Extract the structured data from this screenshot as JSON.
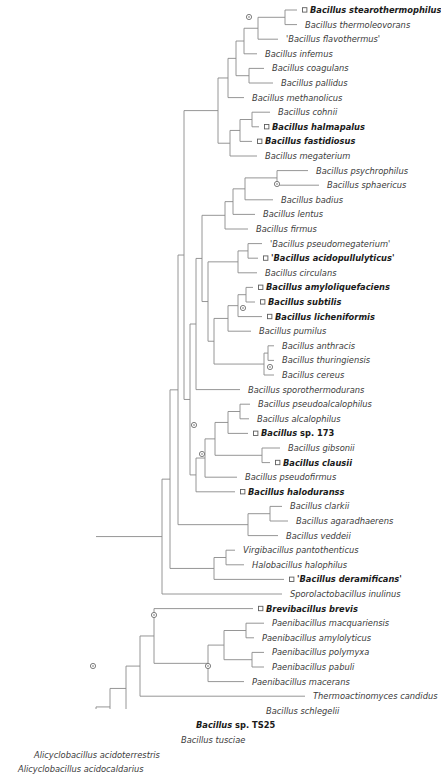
{
  "figure": {
    "type": "phylogram",
    "colors": {
      "branch": "#8a8a8a",
      "label": "#3b3b3b",
      "label_bold": "#1a1a1a",
      "node_marker": "#6f6f6f",
      "background": "#ffffff"
    },
    "marker_legend": {
      "circle_node": "internal-node-support-marker",
      "square_tip": "highlighted-taxon-marker"
    }
  },
  "taxa": [
    {
      "id": "t1",
      "label": "Bacillus stearothermophilus",
      "bold": true,
      "marker": true,
      "x": 310,
      "y": 10,
      "branch_x": 297
    },
    {
      "id": "t2",
      "label": "Bacillus thermoleovorans",
      "bold": false,
      "marker": false,
      "x": 305,
      "y": 24.6,
      "branch_x": 297
    },
    {
      "id": "t3",
      "label": "'Bacillus flavothermus'",
      "bold": false,
      "marker": false,
      "x": 286,
      "y": 39.2,
      "branch_x": 278
    },
    {
      "id": "t4",
      "label": "Bacillus infemus",
      "bold": false,
      "marker": false,
      "x": 265,
      "y": 53.8,
      "branch_x": 257
    },
    {
      "id": "t5",
      "label": "Bacillus coagulans",
      "bold": false,
      "marker": false,
      "x": 272,
      "y": 68.4,
      "branch_x": 264
    },
    {
      "id": "t6",
      "label": "Bacillus pallidus",
      "bold": false,
      "marker": false,
      "x": 281,
      "y": 83,
      "branch_x": 273
    },
    {
      "id": "t7",
      "label": "Bacillus methanolicus",
      "bold": false,
      "marker": false,
      "x": 252,
      "y": 97.6,
      "branch_x": 244
    },
    {
      "id": "t8",
      "label": "Bacillus cohnii",
      "bold": false,
      "marker": false,
      "x": 278,
      "y": 112.2,
      "branch_x": 270
    },
    {
      "id": "t9",
      "label": "Bacillus halmapalus",
      "bold": true,
      "marker": true,
      "x": 272,
      "y": 126.8,
      "branch_x": 259
    },
    {
      "id": "t10",
      "label": "Bacillus fastidiosus",
      "bold": true,
      "marker": true,
      "x": 265,
      "y": 141.4,
      "branch_x": 252
    },
    {
      "id": "t11",
      "label": "Bacillus megaterium",
      "bold": false,
      "marker": false,
      "x": 265,
      "y": 156,
      "branch_x": 257
    },
    {
      "id": "t12",
      "label": "Bacillus psychrophilus",
      "bold": false,
      "marker": false,
      "x": 316,
      "y": 177,
      "branch_x": 308
    },
    {
      "id": "t13",
      "label": "Bacillus sphaericus",
      "bold": false,
      "marker": false,
      "x": 327,
      "y": 191.6,
      "branch_x": 319
    },
    {
      "id": "t14",
      "label": "Bacillus badius",
      "bold": false,
      "marker": false,
      "x": 281,
      "y": 206.2,
      "branch_x": 273
    },
    {
      "id": "t15",
      "label": "Bacillus lentus",
      "bold": false,
      "marker": false,
      "x": 263,
      "y": 220.8,
      "branch_x": 255
    },
    {
      "id": "t16",
      "label": "Bacillus firmus",
      "bold": false,
      "marker": false,
      "x": 256,
      "y": 235.4,
      "branch_x": 248
    },
    {
      "id": "t17",
      "label": "'Bacillus pseudomegaterium'",
      "bold": false,
      "marker": false,
      "x": 270,
      "y": 250,
      "branch_x": 262
    },
    {
      "id": "t18",
      "label": "'Bacillus acidopullulyticus'",
      "bold": true,
      "marker": true,
      "x": 271,
      "y": 264.6,
      "branch_x": 258
    },
    {
      "id": "t19",
      "label": "Bacillus circulans",
      "bold": false,
      "marker": false,
      "x": 265,
      "y": 279.2,
      "branch_x": 257
    },
    {
      "id": "t20",
      "label": "Bacillus amyloliquefaciens",
      "bold": true,
      "marker": true,
      "x": 266,
      "y": 293.8,
      "branch_x": 253
    },
    {
      "id": "t21",
      "label": "Bacillus subtilis",
      "bold": true,
      "marker": true,
      "x": 268,
      "y": 308.4,
      "branch_x": 255
    },
    {
      "id": "t22",
      "label": "Bacillus licheniformis",
      "bold": true,
      "marker": true,
      "x": 275,
      "y": 323,
      "branch_x": 262
    },
    {
      "id": "t23",
      "label": "Bacillus pumilus",
      "bold": false,
      "marker": false,
      "x": 259,
      "y": 337.6,
      "branch_x": 251
    },
    {
      "id": "t24",
      "label": "Bacillus anthracis",
      "bold": false,
      "marker": false,
      "x": 282,
      "y": 352.2,
      "branch_x": 274
    },
    {
      "id": "t25",
      "label": "Bacillus thuringiensis",
      "bold": false,
      "marker": false,
      "x": 282,
      "y": 366.8,
      "branch_x": 274
    },
    {
      "id": "t26",
      "label": "Bacillus cereus",
      "bold": false,
      "marker": false,
      "x": 282,
      "y": 381.4,
      "branch_x": 274
    },
    {
      "id": "t27",
      "label": "Bacillus sporothermodurans",
      "bold": false,
      "marker": false,
      "x": 248,
      "y": 396,
      "branch_x": 240
    },
    {
      "id": "t28",
      "label": "Bacillus pseudoalcalophilus",
      "bold": false,
      "marker": false,
      "x": 258,
      "y": 410.6,
      "branch_x": 250
    },
    {
      "id": "t29",
      "label": "Bacillus alcalophilus",
      "bold": false,
      "marker": false,
      "x": 257,
      "y": 425.2,
      "branch_x": 249
    },
    {
      "id": "t30",
      "label": "Bacillus sp. 173",
      "bold": true,
      "marker": true,
      "x": 261,
      "y": 439.8,
      "branch_x": 248
    },
    {
      "id": "t31",
      "label": "Bacillus gibsonii",
      "bold": false,
      "marker": false,
      "x": 288,
      "y": 454.4,
      "branch_x": 280
    },
    {
      "id": "t32",
      "label": "Bacillus clausii",
      "bold": true,
      "marker": true,
      "x": 283,
      "y": 469,
      "branch_x": 270
    },
    {
      "id": "t33",
      "label": "Bacillus pseudofirmus",
      "bold": false,
      "marker": false,
      "x": 245,
      "y": 483.6,
      "branch_x": 237
    },
    {
      "id": "t34",
      "label": "Bacillus haloduranss",
      "bold": true,
      "marker": true,
      "x": 248,
      "y": 498.2,
      "branch_x": 235
    },
    {
      "id": "t35",
      "label": "Bacillus clarkii",
      "bold": false,
      "marker": false,
      "x": 290,
      "y": 512.8,
      "branch_x": 282
    },
    {
      "id": "t36",
      "label": "Bacillus agaradhaerens",
      "bold": false,
      "marker": false,
      "x": 296,
      "y": 527.4,
      "branch_x": 288
    },
    {
      "id": "t37",
      "label": "Bacillus veddeii",
      "bold": false,
      "marker": false,
      "x": 286,
      "y": 542,
      "branch_x": 278
    },
    {
      "id": "t38",
      "label": "Virgibacillus pantothenticus",
      "bold": false,
      "marker": false,
      "x": 243,
      "y": 556.6,
      "branch_x": 235
    },
    {
      "id": "t39",
      "label": "Halobacillus halophilus",
      "bold": false,
      "marker": false,
      "x": 252,
      "y": 571.2,
      "branch_x": 244
    },
    {
      "id": "t40",
      "label": "'Bacillus deramificans'",
      "bold": true,
      "marker": true,
      "x": 297,
      "y": 585.8,
      "branch_x": 284
    },
    {
      "id": "t41",
      "label": "Sporolactobacillus inulinus",
      "bold": false,
      "marker": false,
      "x": 290,
      "y": 600.4,
      "branch_x": 282
    },
    {
      "id": "t42",
      "label": "Brevibacillus brevis",
      "bold": true,
      "marker": true,
      "x": 266,
      "y": 615,
      "branch_x": 253
    },
    {
      "id": "t43",
      "label": "Paenibacillus macquariensis",
      "bold": false,
      "marker": false,
      "x": 272,
      "y": 629.6,
      "branch_x": 264
    },
    {
      "id": "t44",
      "label": "Paenibacillus amylolyticus",
      "bold": false,
      "marker": false,
      "x": 262,
      "y": 644.2,
      "branch_x": 254
    },
    {
      "id": "t45",
      "label": "Paenibacillus polymyxa",
      "bold": false,
      "marker": false,
      "x": 272,
      "y": 658.8,
      "branch_x": 264
    },
    {
      "id": "t46",
      "label": "Paenibacillus pabuli",
      "bold": false,
      "marker": false,
      "x": 272,
      "y": 673.4,
      "branch_x": 264
    },
    {
      "id": "t47",
      "label": "Paenibacillus macerans",
      "bold": false,
      "marker": false,
      "x": 252,
      "y": 688,
      "branch_x": 244
    },
    {
      "id": "t48",
      "label": "Thermoactinomyces candidus",
      "bold": false,
      "marker": false,
      "x": 313,
      "y": 702.6,
      "branch_x": 305
    },
    {
      "id": "t49",
      "label": "Bacillus schlegelii",
      "bold": false,
      "marker": false,
      "x": 266,
      "y": 717.2,
      "branch_x": 258
    },
    {
      "id": "t50",
      "label": "Bacillus sp. TS25",
      "bold": true,
      "marker": true,
      "x": 196,
      "y": 731.8,
      "branch_x": 183
    },
    {
      "id": "t51",
      "label": "Bacillus tusciae",
      "bold": false,
      "marker": false,
      "x": 181,
      "y": 746.4,
      "branch_x": 173
    },
    {
      "id": "t52",
      "label": "Alicyclobacillus acidoterrestris",
      "bold": false,
      "marker": false,
      "x": 34,
      "y": 761,
      "branch_x": 26
    },
    {
      "id": "t53",
      "label": "Alicyclobacillus acidocaldarius",
      "bold": false,
      "marker": false,
      "x": 18,
      "y": 775.6,
      "branch_x": 10
    }
  ],
  "node_markers": [
    {
      "name": "node-stearothermophilus-clade",
      "x": 249,
      "y": 17
    },
    {
      "name": "node-psychrophilus-sphaericus",
      "x": 277,
      "y": 184
    },
    {
      "name": "node-subtilis-clade",
      "x": 243,
      "y": 308
    },
    {
      "name": "node-cereus-group",
      "x": 270,
      "y": 367
    },
    {
      "name": "node-alkaliphilic-clade",
      "x": 202,
      "y": 454
    },
    {
      "name": "node-bacillus-core",
      "x": 194,
      "y": 425
    },
    {
      "name": "node-brevibacillus-paenibacillus",
      "x": 154,
      "y": 615
    },
    {
      "name": "node-paenibacillus-polymyxa",
      "x": 208,
      "y": 666
    },
    {
      "name": "node-deep-backbone",
      "x": 93,
      "y": 666
    },
    {
      "name": "node-root",
      "x": 14,
      "y": 768
    }
  ],
  "scale": {
    "row_height": 14.6,
    "first_row_y": 10
  }
}
